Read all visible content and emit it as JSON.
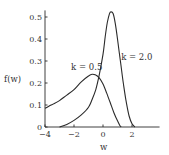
{
  "chart_data": {
    "type": "line",
    "title": "",
    "xlabel": "w",
    "ylabel": "f(w)",
    "xlim": [
      -4,
      3.9
    ],
    "ylim": [
      0,
      0.53
    ],
    "grid": false,
    "legend": "inline annotations",
    "x_ticks": [
      -4,
      -2,
      0,
      2
    ],
    "x_tick_labels": [
      "−4",
      "−2",
      "0",
      "2"
    ],
    "y_ticks": [
      0,
      0.1,
      0.2,
      0.3,
      0.4,
      0.5
    ],
    "y_tick_labels": [
      "0",
      "0.1",
      "0.2",
      "0.3",
      "0.4",
      "0.5"
    ],
    "series": [
      {
        "name": "k = 0.5",
        "label_pos": [
          -2.2,
          0.258
        ],
        "x": [
          -4,
          -3.5,
          -3,
          -2.5,
          -2,
          -1.5,
          -1,
          -0.75,
          -0.5,
          -0.25,
          0,
          0.25,
          0.5,
          0.75,
          1,
          1.15,
          1.25
        ],
        "y": [
          0.085,
          0.102,
          0.12,
          0.145,
          0.17,
          0.205,
          0.232,
          0.24,
          0.236,
          0.222,
          0.195,
          0.155,
          0.11,
          0.065,
          0.028,
          0.008,
          0
        ]
      },
      {
        "name": "k = 2.0",
        "label_pos": [
          1.25,
          0.305
        ],
        "x": [
          -3,
          -2.5,
          -2,
          -1.5,
          -1,
          -0.75,
          -0.5,
          -0.25,
          0,
          0.15,
          0.3,
          0.45,
          0.55,
          0.7,
          0.85,
          1,
          1.2,
          1.4,
          1.6,
          1.8,
          2.0,
          2.2
        ],
        "y": [
          0,
          0.012,
          0.03,
          0.055,
          0.09,
          0.125,
          0.17,
          0.24,
          0.33,
          0.41,
          0.475,
          0.515,
          0.523,
          0.515,
          0.47,
          0.4,
          0.3,
          0.2,
          0.115,
          0.05,
          0.015,
          0
        ]
      }
    ]
  }
}
